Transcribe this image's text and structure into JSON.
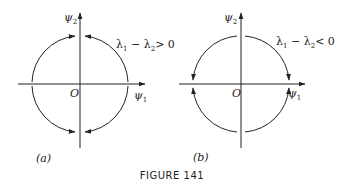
{
  "figure": {
    "caption": "FIGURE 141",
    "panels": [
      {
        "id": "a",
        "label": "(a)",
        "x_axis_label": "ψ",
        "x_axis_sub": "1",
        "y_axis_label": "ψ",
        "y_axis_sub": "2",
        "origin_label": "O",
        "condition": {
          "lhs1": "λ",
          "lhs1_sub": "1",
          "op": " − ",
          "lhs2": "λ",
          "lhs2_sub": "2",
          "rel": "> 0"
        },
        "flow": "toward vertical axis (ψ2)"
      },
      {
        "id": "b",
        "label": "(b)",
        "x_axis_label": "ψ",
        "x_axis_sub": "1",
        "y_axis_label": "ψ",
        "y_axis_sub": "2",
        "origin_label": "O",
        "condition": {
          "lhs1": "λ",
          "lhs1_sub": "1",
          "op": " − ",
          "lhs2": "λ",
          "lhs2_sub": "2",
          "rel": "< 0"
        },
        "flow": "toward horizontal axis (ψ1)"
      }
    ],
    "colors": {
      "ink": "#222222",
      "background": "#ffffff"
    }
  }
}
